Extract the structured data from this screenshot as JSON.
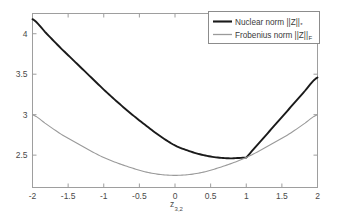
{
  "chart_data": {
    "type": "line",
    "title": "",
    "xlabel": "z",
    "xlabel_sub": "3,2",
    "ylabel": "",
    "xlim": [
      -2,
      2
    ],
    "ylim": [
      2.1,
      4.25
    ],
    "grid": false,
    "legend_position": "top-right",
    "x_ticks": [
      "-2",
      "-1.5",
      "-1",
      "-0.5",
      "0",
      "0.5",
      "1",
      "1.5",
      "2"
    ],
    "x_tick_values": [
      -2,
      -1.5,
      -1,
      -0.5,
      0,
      0.5,
      1,
      1.5,
      2
    ],
    "y_ticks": [
      "2.5",
      "3",
      "3.5",
      "4"
    ],
    "y_tick_values": [
      2.5,
      3,
      3.5,
      4
    ],
    "series": [
      {
        "name": "Nuclear norm",
        "symbol_prefix": "||Z||",
        "symbol_sub": "*",
        "legend_label": "Nuclear norm  ||Z||",
        "color": "#1a1a1a",
        "width": 1.9,
        "x": [
          -2,
          -1.8,
          -1.6,
          -1.4,
          -1.2,
          -1,
          -0.8,
          -0.6,
          -0.4,
          -0.2,
          0,
          0.2,
          0.4,
          0.6,
          0.8,
          1,
          1.2,
          1.4,
          1.6,
          1.8,
          2
        ],
        "values": [
          4.18,
          4.0,
          3.82,
          3.65,
          3.48,
          3.31,
          3.15,
          3.0,
          2.86,
          2.73,
          2.62,
          2.55,
          2.5,
          2.47,
          2.46,
          2.47,
          2.67,
          2.87,
          3.07,
          3.27,
          3.46
        ]
      },
      {
        "name": "Frobenius norm",
        "symbol_prefix": "||Z||",
        "symbol_sub": "F",
        "legend_label": "Frobenius norm  ||Z||",
        "color": "#9a9a9a",
        "width": 1.1,
        "x": [
          -2,
          -1.8,
          -1.6,
          -1.4,
          -1.2,
          -1,
          -0.8,
          -0.6,
          -0.4,
          -0.2,
          0,
          0.2,
          0.4,
          0.6,
          0.8,
          1,
          1.2,
          1.4,
          1.6,
          1.8,
          2
        ],
        "values": [
          3.0,
          2.88,
          2.76,
          2.66,
          2.56,
          2.47,
          2.4,
          2.34,
          2.29,
          2.26,
          2.25,
          2.26,
          2.29,
          2.34,
          2.4,
          2.47,
          2.56,
          2.66,
          2.76,
          2.88,
          3.0
        ]
      }
    ],
    "annotations": [
      {
        "text": "kink",
        "x": 1,
        "y": 2.47
      }
    ]
  },
  "axes": {
    "frame_color": "#9e9e9e",
    "background": "#ffffff"
  },
  "legend": {
    "border_color": "#8c8c8c",
    "background": "#ffffff"
  }
}
